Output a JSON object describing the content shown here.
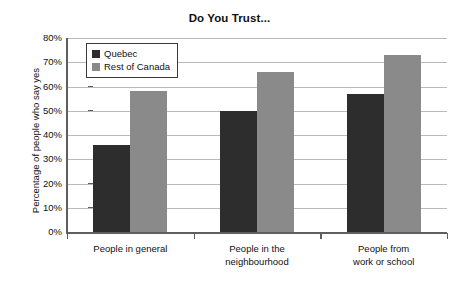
{
  "chart_data": {
    "type": "bar",
    "title": "Do You Trust...",
    "xlabel": "",
    "ylabel": "Percentage of people who say yes",
    "ylim": [
      0,
      80
    ],
    "ytick_labels": [
      "80%",
      "70%",
      "60%",
      "50%",
      "40%",
      "30%",
      "20%",
      "10%",
      "0%"
    ],
    "ytick_values": [
      80,
      70,
      60,
      50,
      40,
      30,
      20,
      10,
      0
    ],
    "grid": true,
    "legend_position": "upper-left-inside",
    "categories": [
      "People in general",
      "People in the neighbourhood",
      "People from work or school"
    ],
    "category_lines": [
      [
        "People in general"
      ],
      [
        "People in the",
        "neighbourhood"
      ],
      [
        "People from",
        "work or school"
      ]
    ],
    "series": [
      {
        "name": "Quebec",
        "color": "#2d2d2d",
        "values": [
          36,
          50,
          57
        ]
      },
      {
        "name": "Rest of Canada",
        "color": "#8a8a8a",
        "values": [
          58,
          66,
          73
        ]
      }
    ]
  },
  "legend": {
    "items": [
      {
        "label": "Quebec"
      },
      {
        "label": "Rest of Canada"
      }
    ]
  }
}
